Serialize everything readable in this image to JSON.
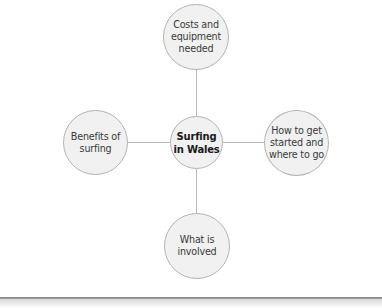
{
  "diagram": {
    "type": "spider-diagram",
    "center": {
      "label": "Surfing\nin Wales"
    },
    "branches": [
      {
        "position": "top",
        "label": "Costs and\nequipment\nneeded"
      },
      {
        "position": "left",
        "label": "Benefits of\nsurfing"
      },
      {
        "position": "right",
        "label": "How to get\nstarted and\nwhere to go"
      },
      {
        "position": "bottom",
        "label": "What is\ninvolved"
      }
    ]
  },
  "colors": {
    "node_fill": "#f1f1f1",
    "node_border": "#b3b3b3",
    "connector": "#b9b9b9",
    "text": "#3a3a3a",
    "center_text": "#1a1a1a",
    "rule": "#7c7c7c"
  }
}
